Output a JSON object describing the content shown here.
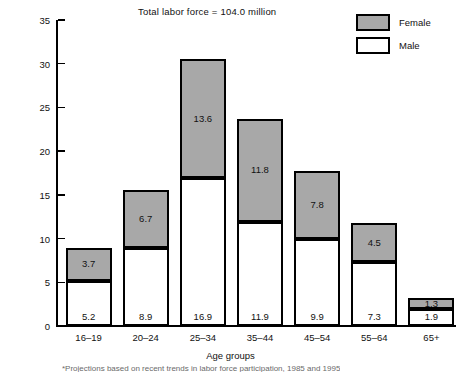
{
  "title": "Total labor force = 104.0 million",
  "legend": {
    "position": "top-right",
    "entries": [
      {
        "label": "Female",
        "color": "#a8a8a8",
        "key": "female"
      },
      {
        "label": "Male",
        "color": "#ffffff",
        "key": "male"
      }
    ]
  },
  "axes": {
    "ylabel": "Millions of workers",
    "xlabel": "Age groups",
    "yticks": [
      0,
      5,
      10,
      15,
      20,
      25,
      30,
      35
    ],
    "ytick_labels": [
      "0",
      "5",
      "10",
      "15",
      "20",
      "25",
      "30",
      "35"
    ]
  },
  "footnote": "*Projections based on recent trends in labor force participation, 1985 and 1995",
  "colors": {
    "female_fill": "#a8a8a8",
    "male_fill": "#ffffff",
    "outline": "#000000",
    "text": "#111111"
  },
  "chart_data": {
    "type": "bar",
    "subtype": "stacked-vertical",
    "title": "Total labor force = 104.0 million",
    "xlabel": "Age groups",
    "ylabel": "Millions of workers",
    "ylim": [
      0,
      35
    ],
    "grid": false,
    "legend_position": "top-right",
    "categories": [
      "16–19",
      "20–24",
      "25–34",
      "35–44",
      "45–54",
      "55–64",
      "65+"
    ],
    "series": [
      {
        "name": "Male",
        "values": [
          5.2,
          8.9,
          16.9,
          11.9,
          9.9,
          7.3,
          1.9
        ]
      },
      {
        "name": "Female",
        "values": [
          3.7,
          6.7,
          13.6,
          11.8,
          7.8,
          4.5,
          1.3
        ]
      }
    ],
    "totals": [
      8.9,
      15.6,
      30.5,
      23.7,
      17.7,
      11.8,
      3.2
    ],
    "total_labor_force": 104.0
  },
  "bars": [
    {
      "category": "16–19",
      "male": "5.2",
      "female": "3.7"
    },
    {
      "category": "20–24",
      "male": "8.9",
      "female": "6.7"
    },
    {
      "category": "25–34",
      "male": "16.9",
      "female": "13.6"
    },
    {
      "category": "35–44",
      "male": "11.9",
      "female": "11.8"
    },
    {
      "category": "45–54",
      "male": "9.9",
      "female": "7.8"
    },
    {
      "category": "55–64",
      "male": "7.3",
      "female": "4.5"
    },
    {
      "category": "65+",
      "male": "1.9",
      "female": "1.3"
    }
  ]
}
